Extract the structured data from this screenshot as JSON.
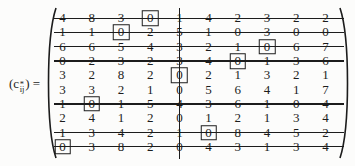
{
  "formula": {
    "open_paren": "(",
    "symbol": "c",
    "superscript": "*",
    "subscript": "ij",
    "close_paren": ")",
    "equals": "="
  },
  "matrix": {
    "rows": [
      [
        "4",
        "8",
        "3",
        "0",
        "1",
        "4",
        "2",
        "3",
        "2",
        "2"
      ],
      [
        "1",
        "1",
        "0",
        "2",
        "5",
        "1",
        "0",
        "3",
        "0",
        "0"
      ],
      [
        "6",
        "6",
        "5",
        "4",
        "3",
        "2",
        "1",
        "0",
        "6",
        "7"
      ],
      [
        "0",
        "2",
        "3",
        "2",
        "3",
        "4",
        "0",
        "1",
        "3",
        "6"
      ],
      [
        "3",
        "2",
        "8",
        "2",
        "0",
        "2",
        "1",
        "3",
        "2",
        "1"
      ],
      [
        "3",
        "3",
        "2",
        "1",
        "0",
        "5",
        "6",
        "4",
        "1",
        "7"
      ],
      [
        "1",
        "0",
        "1",
        "5",
        "4",
        "3",
        "6",
        "1",
        "0",
        "4"
      ],
      [
        "2",
        "4",
        "1",
        "2",
        "0",
        "1",
        "2",
        "1",
        "3",
        "4"
      ],
      [
        "1",
        "3",
        "4",
        "2",
        "1",
        "0",
        "8",
        "4",
        "5",
        "2"
      ],
      [
        "0",
        "3",
        "8",
        "2",
        "0",
        "4",
        "3",
        "1",
        "3",
        "4"
      ]
    ],
    "boxed_cells": [
      [
        0,
        3
      ],
      [
        1,
        2
      ],
      [
        2,
        7
      ],
      [
        3,
        6
      ],
      [
        4,
        4
      ],
      [
        6,
        1
      ],
      [
        8,
        5
      ],
      [
        9,
        0
      ]
    ],
    "covered_rows": [
      0,
      1,
      2,
      3,
      6,
      8,
      9
    ],
    "covered_columns": [
      4
    ]
  },
  "colors": {
    "ink": "#1c1c1c",
    "background": "#fcfcfb"
  }
}
